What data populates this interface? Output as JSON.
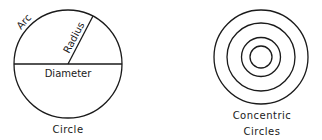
{
  "diagram": {
    "stroke_color": "#1a1a1a",
    "background": "#ffffff",
    "circle": {
      "caption": "Circle",
      "labels": {
        "arc": "Arc",
        "radius": "Radius",
        "diameter": "Diameter"
      },
      "center": [
        68,
        64
      ],
      "radius": 54
    },
    "concentric": {
      "caption_line1": "Concentric",
      "caption_line2": "Circles",
      "center": [
        261,
        57
      ],
      "radii": [
        47,
        34,
        19.5,
        11
      ]
    }
  }
}
